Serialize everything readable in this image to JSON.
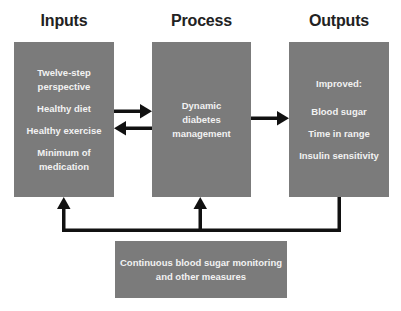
{
  "headings": {
    "inputs": "Inputs",
    "process": "Process",
    "outputs": "Outputs"
  },
  "inputs_box": {
    "items": [
      "Twelve-step perspective",
      "Healthy diet",
      "Healthy exercise",
      "Minimum of medication"
    ],
    "lines": {
      "item0_line1": "Twelve-step",
      "item0_line2": "perspective",
      "item1": "Healthy diet",
      "item2": "Healthy exercise",
      "item3_line1": "Minimum of",
      "item3_line2": "medication"
    }
  },
  "process_box": {
    "text": "Dynamic diabetes management",
    "lines": {
      "line1": "Dynamic",
      "line2": "diabetes",
      "line3": "management"
    }
  },
  "outputs_box": {
    "label": "Improved:",
    "items": [
      "Blood sugar",
      "Time in range",
      "Insulin sensitivity"
    ]
  },
  "monitoring_box": {
    "text": "Continuous blood sugar monitoring and other measures",
    "lines": {
      "line1": "Continuous blood sugar monitoring",
      "line2": "and other measures"
    }
  },
  "connections": [
    {
      "from": "Inputs",
      "to": "Process",
      "direction": "right"
    },
    {
      "from": "Process",
      "to": "Inputs",
      "direction": "left"
    },
    {
      "from": "Process",
      "to": "Outputs",
      "direction": "right"
    },
    {
      "from": "Outputs",
      "to": "Inputs",
      "via": "feedback loop",
      "direction": "up"
    },
    {
      "from": "Outputs",
      "to": "Process",
      "via": "feedback loop",
      "direction": "up"
    }
  ],
  "colors": {
    "box_fill": "#7b7b7b",
    "box_text": "#f2f2f2",
    "heading_text": "#222222",
    "arrow": "#111111",
    "background": "#ffffff"
  }
}
